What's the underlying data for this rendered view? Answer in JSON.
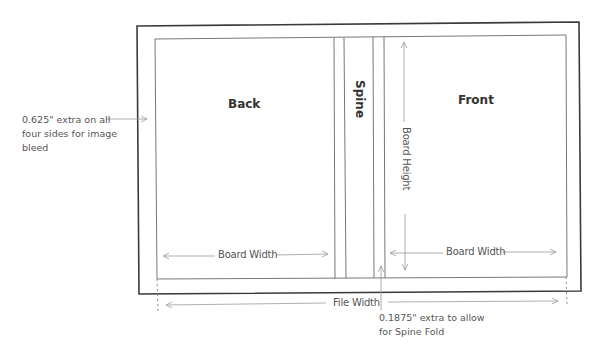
{
  "diagram": {
    "panels": {
      "back": "Back",
      "spine": "Spine",
      "front": "Front"
    },
    "dimensions": {
      "board_width_left": "Board Width",
      "board_width_right": "Board Width",
      "board_height": "Board Height",
      "file_width": "File Width"
    },
    "notes": {
      "bleed_line1": "0.625\" extra on all",
      "bleed_line2": "four sides for image",
      "bleed_line3": "bleed",
      "spine_fold_line1": "0.1875\" extra to allow",
      "spine_fold_line2": "for Spine Fold"
    },
    "colors": {
      "outer_border": "#3a3a3a",
      "inner_border": "#6a6a6a",
      "arrow": "#9a9a9a",
      "text": "#555555"
    }
  }
}
